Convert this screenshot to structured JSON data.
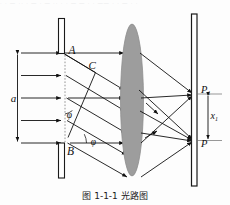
{
  "figure": {
    "caption": "图 1-1-1  光路图",
    "top_scan_text": "· · — ·· · — · — ·· · · — — · · —— · · — · ·"
  },
  "labels": {
    "slit_top": "A",
    "slit_mid": "C",
    "slit_bottom": "B",
    "aperture_width": "a",
    "angle_upper": "φ",
    "angle_lower": "φ",
    "screen_point_upper": "P",
    "screen_point_upper_sub": "1",
    "screen_point_lower": "P",
    "screen_distance": "x",
    "screen_distance_sub": "1"
  },
  "colors": {
    "ink": "#111111",
    "lens_fill": "#9d9d9d",
    "lens_stroke": "#8a8a8a",
    "plate_fill": "#ffffff",
    "plate_stroke": "#1a1a1a",
    "guide": "#6b6b6b",
    "background": "#fdfdfd"
  },
  "geometry": {
    "slit_plane_x": 62,
    "lens_center_x": 132,
    "screen_x": 194,
    "axis_y": 98,
    "slit_top_y": 53,
    "slit_bottom_y": 143,
    "screen_point_upper_y": 93,
    "screen_point_lower_y": 140
  },
  "elements": {
    "upper_plate": "slit-plate-upper",
    "lower_plate": "slit-plate-lower",
    "lens": "converging-lens",
    "screen": "observation-screen",
    "incident_rays": 5,
    "diffracted_rays": 5,
    "wavefront_line": "wavefront-AB-dashed"
  }
}
